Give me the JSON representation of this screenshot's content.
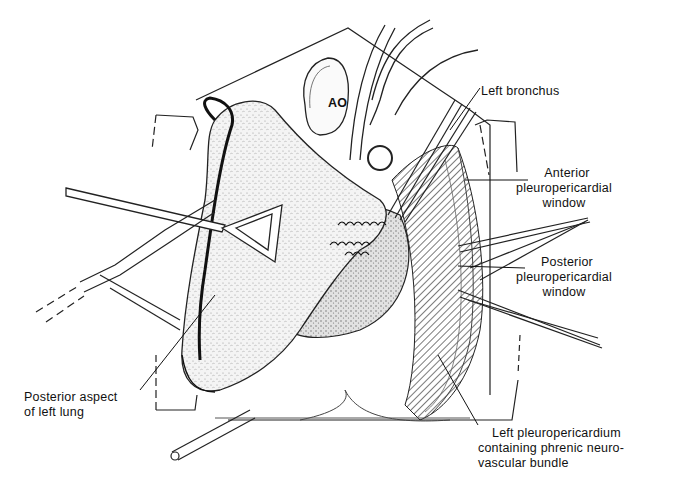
{
  "figure": {
    "colors": {
      "ink": "#111111",
      "paper": "#ffffff",
      "stipple": "#e6e6e6",
      "hatch": "#333333"
    }
  },
  "labels": {
    "aorta": "AO",
    "left_bronchus": "Left bronchus",
    "anterior_window": {
      "line1": "Anterior",
      "line2": "pleuropericardial",
      "line3": "window"
    },
    "posterior_window": {
      "line1": "Posterior",
      "line2": "pleuropericardial",
      "line3": "window"
    },
    "lung": {
      "line1": "Posterior aspect",
      "line2": "of left lung"
    },
    "pleuropericardium": {
      "line1": "Left pleuropericardium",
      "line2": "containing phrenic neuro-",
      "line3": "vascular bundle"
    }
  }
}
